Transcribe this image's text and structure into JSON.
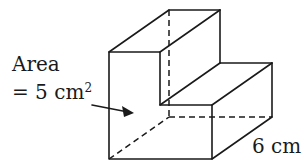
{
  "diagram": {
    "type": "3d-step-prism",
    "labels": {
      "area_title": "Area",
      "area_value": "= 5 cm",
      "area_exponent": "2",
      "depth": "6 cm"
    },
    "colors": {
      "stroke": "#1a1a1a",
      "background": "#ffffff"
    },
    "front_face_points": [
      [
        109,
        52
      ],
      [
        160,
        52
      ],
      [
        160,
        105
      ],
      [
        212,
        105
      ],
      [
        212,
        159
      ],
      [
        109,
        159
      ]
    ],
    "depth_offset": [
      60,
      -42
    ]
  }
}
